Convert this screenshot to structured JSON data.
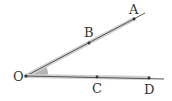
{
  "diagram": {
    "type": "angle-with-rays",
    "vertex": {
      "label": "O",
      "x": 26,
      "y": 76
    },
    "ray_upper": {
      "points": [
        {
          "label": "B",
          "x": 89,
          "y": 43
        },
        {
          "label": "A",
          "x": 134,
          "y": 19
        }
      ],
      "end": {
        "x": 145,
        "y": 13
      }
    },
    "ray_lower": {
      "points": [
        {
          "label": "C",
          "x": 97,
          "y": 77
        },
        {
          "label": "D",
          "x": 149,
          "y": 78
        }
      ],
      "end": {
        "x": 164,
        "y": 79
      }
    },
    "angle_marker": "shaded-wedge",
    "colors": {
      "line": "#555555",
      "band": "#c8c8c8",
      "wedge": "#b5b5b5",
      "text": "#333333"
    }
  },
  "labels": {
    "O": "O",
    "A": "A",
    "B": "B",
    "C": "C",
    "D": "D"
  }
}
